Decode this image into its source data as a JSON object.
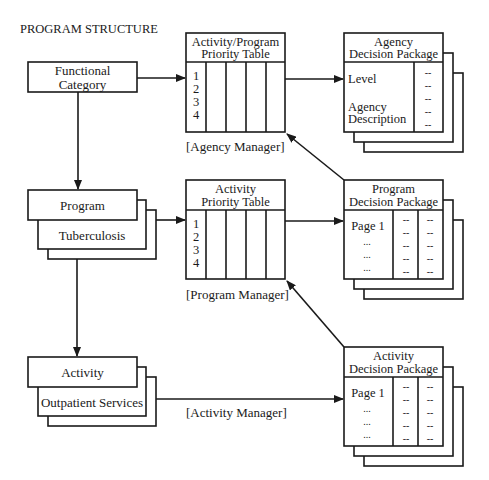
{
  "title": "PROGRAM STRUCTURE",
  "hierarchy": {
    "functional_category": {
      "label_line1": "Functional",
      "label_line2": "Category"
    },
    "program": {
      "label": "Program",
      "example": "Tuberculosis"
    },
    "activity": {
      "label": "Activity",
      "example": "Outpatient Services"
    }
  },
  "priority_tables": {
    "agency": {
      "title_line1": "Activity/Program",
      "title_line2": "Priority Table",
      "rows": [
        "1",
        "2",
        "3",
        "4"
      ],
      "manager": "[Agency Manager]"
    },
    "program": {
      "title_line1": "Activity",
      "title_line2": "Priority Table",
      "rows": [
        "1",
        "2",
        "3",
        "4"
      ],
      "manager": "[Program Manager]"
    },
    "activity": {
      "manager": "[Activity Manager]"
    }
  },
  "decision_packages": {
    "agency": {
      "title_line1": "Agency",
      "title_line2": "Decision Package",
      "items": [
        "Level",
        "Agency",
        "Description"
      ],
      "dashes": [
        "--",
        "--",
        "--",
        "--",
        "--"
      ]
    },
    "program": {
      "title_line1": "Program",
      "title_line2": "Decision Package",
      "items": [
        "Page 1",
        "...",
        "...",
        "..."
      ],
      "dashes_col1": [
        "--",
        "--",
        "--",
        "--",
        "--"
      ],
      "dashes_col2": [
        "--",
        "--",
        "--",
        "--",
        "--"
      ]
    },
    "activity": {
      "title_line1": "Activity",
      "title_line2": "Decision Package",
      "items": [
        "Page 1",
        "...",
        "...",
        "..."
      ],
      "dashes_col1": [
        "--",
        "--",
        "--",
        "--",
        "--"
      ],
      "dashes_col2": [
        "--",
        "--",
        "--",
        "--",
        "--"
      ]
    }
  }
}
